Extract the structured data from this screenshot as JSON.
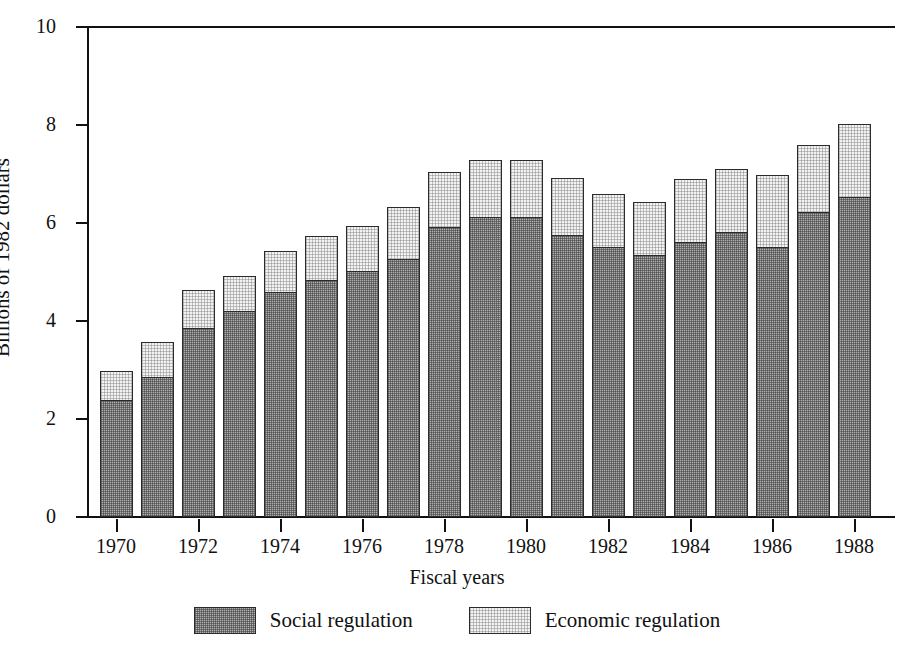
{
  "chart_data": {
    "type": "bar",
    "stacked": true,
    "title": "",
    "xlabel": "Fiscal years",
    "ylabel": "Billions of 1982 dollars",
    "ylim": [
      0,
      10
    ],
    "ytick_labels": [
      "0",
      "2",
      "4",
      "6",
      "8",
      "10"
    ],
    "ytick_values": [
      0,
      2,
      4,
      6,
      8,
      10
    ],
    "grid": false,
    "legend_position": "bottom",
    "categories": [
      "1970",
      "1971",
      "1972",
      "1973",
      "1974",
      "1975",
      "1976",
      "1977",
      "1978",
      "1979",
      "1980",
      "1981",
      "1982",
      "1983",
      "1984",
      "1985",
      "1986",
      "1987",
      "1988"
    ],
    "xtick_labels": [
      "1970",
      "1972",
      "1974",
      "1976",
      "1978",
      "1980",
      "1982",
      "1984",
      "1986",
      "1988"
    ],
    "series": [
      {
        "name": "Social regulation",
        "color": "#b0b0b0",
        "values": [
          2.4,
          2.86,
          3.87,
          4.21,
          4.6,
          4.85,
          5.03,
          5.27,
          5.93,
          6.13,
          6.14,
          5.77,
          5.52,
          5.36,
          5.63,
          5.83,
          5.53,
          6.24,
          6.54
        ]
      },
      {
        "name": "Economic regulation",
        "color": "#f3f3f3",
        "values": [
          0.59,
          0.72,
          0.76,
          0.7,
          0.82,
          0.88,
          0.91,
          1.06,
          1.12,
          1.16,
          1.14,
          1.15,
          1.07,
          1.07,
          1.27,
          1.28,
          1.46,
          1.36,
          1.49
        ]
      }
    ],
    "totals": [
      2.99,
      3.58,
      4.63,
      4.91,
      5.42,
      5.73,
      5.94,
      6.33,
      7.05,
      7.29,
      7.28,
      6.92,
      6.59,
      6.43,
      6.9,
      7.11,
      6.99,
      7.6,
      8.03
    ]
  },
  "legend": {
    "items": [
      {
        "label": "Social regulation",
        "swatch": "social-swatch"
      },
      {
        "label": "Economic regulation",
        "swatch": "economic-swatch"
      }
    ]
  }
}
